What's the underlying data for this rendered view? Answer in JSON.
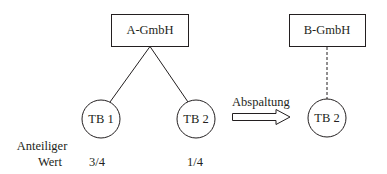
{
  "diagram": {
    "left": {
      "parent": {
        "label": "A-GmbH"
      },
      "children": [
        {
          "label": "TB 1",
          "share": "3/4"
        },
        {
          "label": "TB 2",
          "share": "1/4"
        }
      ]
    },
    "transition": {
      "label": "Abspaltung"
    },
    "right": {
      "parent": {
        "label": "B-GmbH"
      },
      "child": {
        "label": "TB 2"
      }
    },
    "row_label": {
      "line1": "Anteiliger",
      "line2": "Wert"
    }
  },
  "colors": {
    "stroke": "#231f20",
    "background": "#ffffff"
  }
}
